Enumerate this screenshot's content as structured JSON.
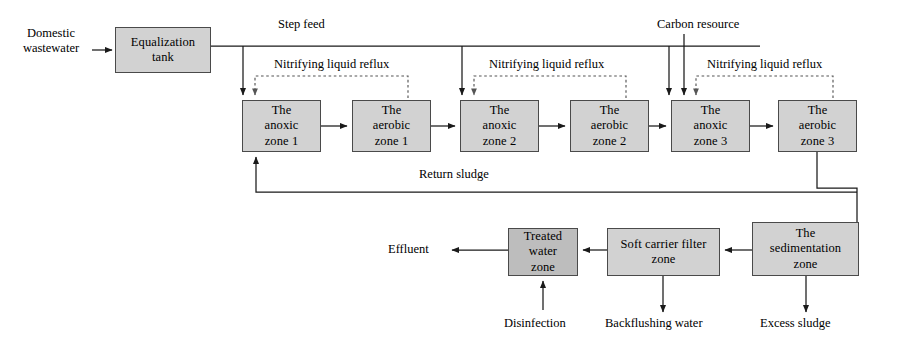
{
  "diagram": {
    "colors": {
      "box_fill": "#d2d2d2",
      "box_fill_dark": "#bdbdbd",
      "box_stroke": "#4a4a4a",
      "line": "#1a1a1a",
      "dashed_line": "#555555",
      "background": "#ffffff"
    },
    "nodes": [
      {
        "id": "equalization-tank",
        "label": "Equalization\ntank",
        "x": 115,
        "y": 27,
        "w": 96,
        "h": 46
      },
      {
        "id": "anoxic-zone-1",
        "label": "The\nanoxic\nzone 1",
        "x": 242,
        "y": 100,
        "w": 79,
        "h": 52
      },
      {
        "id": "aerobic-zone-1",
        "label": "The\naerobic\nzone 1",
        "x": 352,
        "y": 100,
        "w": 79,
        "h": 52
      },
      {
        "id": "anoxic-zone-2",
        "label": "The\nanoxic\nzone 2",
        "x": 460,
        "y": 100,
        "w": 79,
        "h": 52
      },
      {
        "id": "aerobic-zone-2",
        "label": "The\naerobic\nzone 2",
        "x": 570,
        "y": 100,
        "w": 79,
        "h": 52
      },
      {
        "id": "anoxic-zone-3",
        "label": "The\nanoxic\nzone 3",
        "x": 671,
        "y": 100,
        "w": 79,
        "h": 52
      },
      {
        "id": "aerobic-zone-3",
        "label": "The\naerobic\nzone 3",
        "x": 778,
        "y": 100,
        "w": 79,
        "h": 52
      },
      {
        "id": "treated-water-zone",
        "label": "Treated\nwater\nzone",
        "x": 508,
        "y": 228,
        "w": 70,
        "h": 48,
        "dark": true
      },
      {
        "id": "soft-carrier-filter-zone",
        "label": "Soft carrier filter\nzone",
        "x": 607,
        "y": 228,
        "w": 113,
        "h": 48
      },
      {
        "id": "sedimentation-zone",
        "label": "The\nsedimentation\nzone",
        "x": 752,
        "y": 222,
        "w": 107,
        "h": 54
      }
    ],
    "labels": {
      "domestic_wastewater": "Domestic\nwastewater",
      "step_feed": "Step feed",
      "carbon_resource": "Carbon resource",
      "nitrifying_reflux_1": "Nitrifying liquid reflux",
      "nitrifying_reflux_2": "Nitrifying liquid reflux",
      "nitrifying_reflux_3": "Nitrifying liquid reflux",
      "return_sludge": "Return sludge",
      "effluent": "Effluent",
      "disinfection": "Disinfection",
      "backflushing_water": "Backflushing water",
      "excess_sludge": "Excess sludge"
    },
    "flows": [
      {
        "from": "domestic-wastewater-inlet",
        "to": "equalization-tank",
        "type": "solid"
      },
      {
        "from": "equalization-tank",
        "to": "step-feed-header",
        "type": "solid"
      },
      {
        "from": "step-feed-header",
        "to": "anoxic-zone-1",
        "type": "solid"
      },
      {
        "from": "step-feed-header",
        "to": "anoxic-zone-2",
        "type": "solid"
      },
      {
        "from": "step-feed-header",
        "to": "anoxic-zone-3",
        "type": "solid"
      },
      {
        "from": "anoxic-zone-1",
        "to": "aerobic-zone-1",
        "type": "solid"
      },
      {
        "from": "aerobic-zone-1",
        "to": "anoxic-zone-2",
        "type": "solid"
      },
      {
        "from": "anoxic-zone-2",
        "to": "aerobic-zone-2",
        "type": "solid"
      },
      {
        "from": "aerobic-zone-2",
        "to": "anoxic-zone-3",
        "type": "solid"
      },
      {
        "from": "anoxic-zone-3",
        "to": "aerobic-zone-3",
        "type": "solid"
      },
      {
        "from": "aerobic-zone-1",
        "to": "anoxic-zone-1",
        "type": "dashed",
        "label": "Nitrifying liquid reflux"
      },
      {
        "from": "aerobic-zone-2",
        "to": "anoxic-zone-2",
        "type": "dashed",
        "label": "Nitrifying liquid reflux"
      },
      {
        "from": "aerobic-zone-3",
        "to": "anoxic-zone-3",
        "type": "dashed",
        "label": "Nitrifying liquid reflux"
      },
      {
        "from": "carbon-resource-inlet",
        "to": "anoxic-zone-3",
        "type": "solid"
      },
      {
        "from": "aerobic-zone-3",
        "to": "sedimentation-zone",
        "type": "solid"
      },
      {
        "from": "sedimentation-zone",
        "to": "anoxic-zone-1",
        "type": "solid",
        "label": "Return sludge"
      },
      {
        "from": "sedimentation-zone",
        "to": "soft-carrier-filter-zone",
        "type": "solid"
      },
      {
        "from": "soft-carrier-filter-zone",
        "to": "treated-water-zone",
        "type": "solid"
      },
      {
        "from": "treated-water-zone",
        "to": "effluent-outlet",
        "type": "solid"
      },
      {
        "from": "disinfection-inlet",
        "to": "treated-water-zone",
        "type": "solid"
      },
      {
        "from": "soft-carrier-filter-zone",
        "to": "backflushing-water-outlet",
        "type": "solid"
      },
      {
        "from": "sedimentation-zone",
        "to": "excess-sludge-outlet",
        "type": "solid"
      }
    ]
  }
}
